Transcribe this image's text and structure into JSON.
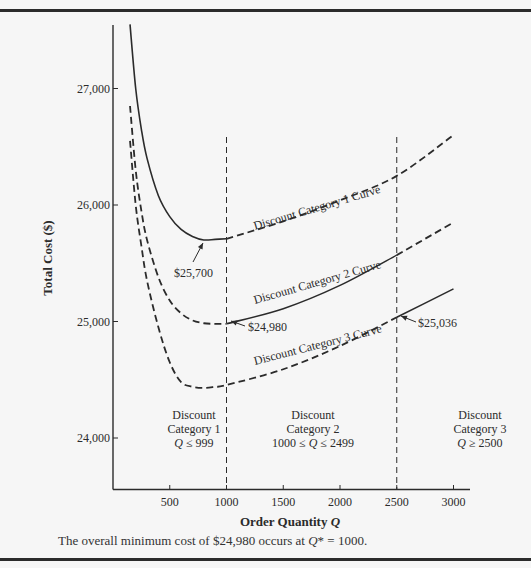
{
  "chart_data": {
    "type": "line",
    "title": "",
    "xlabel": "Order Quantity Q",
    "ylabel": "Total Cost ($)",
    "xlim": [
      0,
      3200
    ],
    "ylim": [
      23600,
      27600
    ],
    "x_ticks": [
      500,
      1000,
      1500,
      2000,
      2500,
      3000
    ],
    "x_tick_labels": [
      "500",
      "1000",
      "1500",
      "2000",
      "2500",
      "3000"
    ],
    "y_ticks": [
      24000,
      25000,
      26000,
      27000
    ],
    "y_tick_labels": [
      "24,000",
      "25,000",
      "26,000",
      "27,000"
    ],
    "grid": false,
    "legend": null,
    "boundaries": [
      {
        "x": 1000,
        "style": "dashed"
      },
      {
        "x": 2500,
        "style": "dashed"
      }
    ],
    "series": [
      {
        "name": "Discount Category 1 Curve",
        "x": [
          150,
          200,
          250,
          300,
          400,
          500,
          600,
          700,
          800,
          900,
          1000,
          1500,
          2000,
          2500,
          3000
        ],
        "values": [
          27550,
          27000,
          26650,
          26400,
          26080,
          25900,
          25790,
          25730,
          25700,
          25705,
          25710,
          25860,
          26040,
          26250,
          26600
        ],
        "solid_range": [
          150,
          999
        ],
        "label_text": "Discount Category 1 Curve"
      },
      {
        "name": "Discount Category 2 Curve",
        "x": [
          150,
          200,
          250,
          300,
          400,
          500,
          600,
          700,
          800,
          900,
          1000,
          1500,
          2000,
          2500,
          3000
        ],
        "values": [
          26850,
          26300,
          25950,
          25700,
          25380,
          25180,
          25070,
          25010,
          24985,
          24980,
          24980,
          25110,
          25310,
          25570,
          25850
        ],
        "solid_range": [
          1000,
          2499
        ],
        "label_text": "Discount Category 2 Curve"
      },
      {
        "name": "Discount Category 3 Curve",
        "x": [
          150,
          200,
          250,
          300,
          400,
          500,
          600,
          700,
          800,
          900,
          1000,
          1500,
          2000,
          2500,
          3000
        ],
        "values": [
          26550,
          26000,
          25650,
          25350,
          24950,
          24650,
          24480,
          24440,
          24430,
          24440,
          24455,
          24590,
          24790,
          25036,
          25280
        ],
        "solid_range": [
          2500,
          3000
        ],
        "label_text": "Discount Category 3 Curve"
      }
    ],
    "annotations": [
      {
        "text": "$25,700",
        "x": 800,
        "y": 25700,
        "arrow": true
      },
      {
        "text": "$24,980",
        "x": 1000,
        "y": 24980,
        "arrow": true
      },
      {
        "text": "$25,036",
        "x": 2500,
        "y": 25036,
        "arrow": true
      }
    ],
    "regions": [
      {
        "lines": [
          "Discount",
          "Category 1",
          "Q ≤ 999"
        ]
      },
      {
        "lines": [
          "Discount",
          "Category 2",
          "1000 ≤ Q ≤ 2499"
        ]
      },
      {
        "lines": [
          "Discount",
          "Category 3",
          "Q ≥ 2500"
        ]
      }
    ]
  },
  "caption": {
    "prefix": "The overall minimum cost of $24,980 occurs at ",
    "var": "Q",
    "suffix": "* = 1000."
  },
  "colors": {
    "ink": "#2b2b2b",
    "background": "#f6f6f6"
  }
}
